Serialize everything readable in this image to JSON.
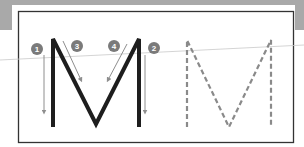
{
  "diagram": {
    "colors": {
      "band": "#a9a9a9",
      "frame": "#333333",
      "letter": "#1e1e1e",
      "arrow": "#8e8e8e",
      "badge": "#7a7a7a",
      "dashed": "#8a8a8a",
      "guideline": "#c9c9c9"
    },
    "strokes": [
      {
        "number": "1",
        "label": "Left vertical stroke down"
      },
      {
        "number": "2",
        "label": "Right vertical stroke down"
      },
      {
        "number": "3",
        "label": "Left diagonal stroke down to center"
      },
      {
        "number": "4",
        "label": "Right diagonal stroke down to center"
      }
    ],
    "panels": [
      {
        "name": "solid-letter-with-stroke-order",
        "letter": "M"
      },
      {
        "name": "dashed-tracing-letter",
        "letter": "M"
      }
    ]
  }
}
